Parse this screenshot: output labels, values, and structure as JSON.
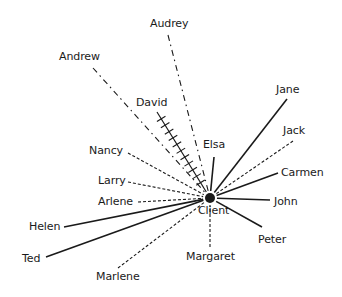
{
  "diagram": {
    "type": "sociogram",
    "center": {
      "label": "Client",
      "x": 210,
      "y": 198,
      "label_x": 198,
      "label_y": 204
    },
    "colors": {
      "ink": "#1a1a1a",
      "background": "#ffffff"
    },
    "line_styles": {
      "solid": "strong relationship",
      "dashed": "weak relationship",
      "dash-dot": "distant relationship",
      "hatched": "conflicted relationship"
    },
    "nodes": [
      {
        "label": "Audrey",
        "style": "dash-dot",
        "lx": 150,
        "ly": 17,
        "ex": 168,
        "ey": 35
      },
      {
        "label": "Andrew",
        "style": "dash-dot",
        "lx": 59,
        "ly": 50,
        "ex": 93,
        "ey": 68
      },
      {
        "label": "David",
        "style": "hatched",
        "lx": 136,
        "ly": 96,
        "ex": 157,
        "ey": 112
      },
      {
        "label": "Elsa",
        "style": "solid",
        "lx": 203,
        "ly": 138,
        "ex": 214,
        "ey": 157
      },
      {
        "label": "Jane",
        "style": "solid",
        "lx": 276,
        "ly": 83,
        "ex": 287,
        "ey": 99
      },
      {
        "label": "Jack",
        "style": "dashed",
        "lx": 283,
        "ly": 124,
        "ex": 293,
        "ey": 141
      },
      {
        "label": "Carmen",
        "style": "solid",
        "lx": 281,
        "ly": 166,
        "ex": 278,
        "ey": 173
      },
      {
        "label": "John",
        "style": "solid",
        "lx": 274,
        "ly": 195,
        "ex": 270,
        "ey": 200
      },
      {
        "label": "Peter",
        "style": "solid",
        "lx": 258,
        "ly": 233,
        "ex": 262,
        "ey": 227
      },
      {
        "label": "Margaret",
        "style": "dashed",
        "lx": 186,
        "ly": 250,
        "ex": 210,
        "ey": 247
      },
      {
        "label": "Marlene",
        "style": "dashed",
        "lx": 96,
        "ly": 270,
        "ex": 118,
        "ey": 268
      },
      {
        "label": "Ted",
        "style": "solid",
        "lx": 22,
        "ly": 252,
        "ex": 46,
        "ey": 257
      },
      {
        "label": "Helen",
        "style": "solid",
        "lx": 29,
        "ly": 220,
        "ex": 64,
        "ey": 227
      },
      {
        "label": "Arlene",
        "style": "dashed",
        "lx": 98,
        "ly": 195,
        "ex": 138,
        "ey": 202
      },
      {
        "label": "Larry",
        "style": "dashed",
        "lx": 98,
        "ly": 174,
        "ex": 128,
        "ey": 182
      },
      {
        "label": "Nancy",
        "style": "dashed",
        "lx": 89,
        "ly": 144,
        "ex": 128,
        "ey": 153
      }
    ]
  }
}
